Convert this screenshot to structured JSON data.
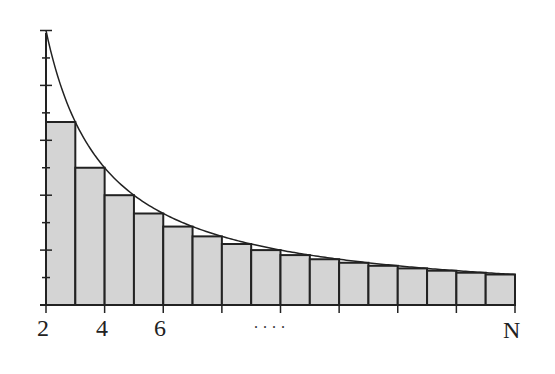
{
  "chart_data": {
    "type": "bar",
    "title": "",
    "xlabel": "",
    "ylabel": "",
    "x_tick_labels": [
      "2",
      "4",
      "6",
      "N"
    ],
    "ellipsis": "....",
    "bar_count": 16,
    "bar_heights_relative": [
      1.0,
      0.7,
      0.53,
      0.41,
      0.33,
      0.27,
      0.22,
      0.19,
      0.16,
      0.14,
      0.12,
      0.11,
      0.1,
      0.09,
      0.08,
      0.07
    ],
    "curve": "y = 1/x (decreasing)",
    "y_ticks": 11,
    "grid": false,
    "colors": {
      "bar_fill": "#d4d4d4",
      "stroke": "#222222"
    }
  },
  "labels": {
    "x2": "2",
    "x4": "4",
    "x6": "6",
    "xN": "N",
    "dots": "...."
  }
}
